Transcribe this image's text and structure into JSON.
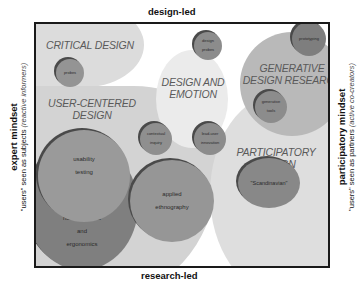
{
  "axes": {
    "top": "design-led",
    "bottom": "research-led",
    "left": {
      "title": "expert mindset",
      "subtitle_prefix": "\"users\" seen as subjects",
      "subtitle_paren": "(reactive informers)"
    },
    "right": {
      "title": "participatory mindset",
      "subtitle_prefix": "\"users\" seen as partners",
      "subtitle_paren": "(active co-creators)"
    }
  },
  "regions": [
    {
      "id": "critical-design",
      "label": "CRITICAL DESIGN"
    },
    {
      "id": "design-and-emotion",
      "label_line1": "DESIGN AND",
      "label_line2": "EMOTION"
    },
    {
      "id": "generative-design-research",
      "label_line1": "GENERATIVE",
      "label_line2": "DESIGN RESEARCH"
    },
    {
      "id": "user-centered-design",
      "label_line1": "USER-CENTERED",
      "label_line2": "DESIGN"
    },
    {
      "id": "participatory-design",
      "label_line1": "PARTICIPATORY",
      "label_line2": "DESIGN"
    }
  ],
  "methods": [
    {
      "id": "probes",
      "line1": "probes"
    },
    {
      "id": "design-probes",
      "line1": "design",
      "line2": "probes"
    },
    {
      "id": "prototyping",
      "line1": "prototyping"
    },
    {
      "id": "generative-tools",
      "line1": "generative",
      "line2": "tools"
    },
    {
      "id": "contextual-inquiry",
      "line1": "contextual",
      "line2": "inquiry"
    },
    {
      "id": "lead-user-innovation",
      "line1": "lead-user",
      "line2": "innovation"
    },
    {
      "id": "usability-testing",
      "line1": "usability",
      "line2": "testing"
    },
    {
      "id": "human-factors",
      "line1": "human factors",
      "line2": "and",
      "line3": "ergonomics"
    },
    {
      "id": "applied-ethnography",
      "line1": "applied",
      "line2": "ethnography"
    },
    {
      "id": "scandinavian",
      "line1": "\"Scandinavian\""
    }
  ],
  "colors": {
    "frame": "#1a1a1a",
    "light_region": "#d9d9d9",
    "lighter_region": "#e6e6e6",
    "mid_region": "#b8b8b8",
    "method_fill": "#8f8f8f",
    "method_dark": "#7a7a7a",
    "label_text": "#5a5a5a"
  }
}
